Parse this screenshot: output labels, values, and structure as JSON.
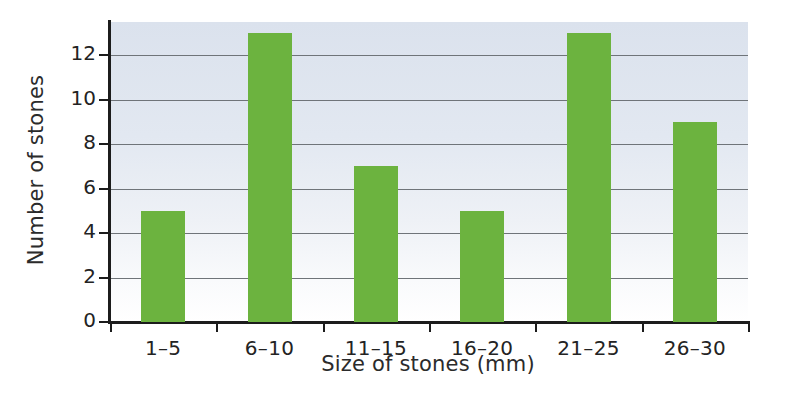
{
  "chart_data": {
    "type": "bar",
    "title": "",
    "subtitle": "",
    "xlabel": "Size of stones (mm)",
    "ylabel": "Number of stones",
    "categories": [
      "1–5",
      "6–10",
      "11–15",
      "16–20",
      "21–25",
      "26–30"
    ],
    "values": [
      5,
      13,
      7,
      5,
      13,
      9
    ],
    "series": [
      {
        "name": "Number of stones",
        "values": [
          5,
          13,
          7,
          5,
          13,
          9
        ]
      }
    ],
    "ylim": [
      0,
      13.5
    ],
    "ytick_values": [
      0,
      2,
      4,
      6,
      8,
      10,
      12
    ],
    "ytick_labels": [
      "0",
      "2",
      "4",
      "6",
      "8",
      "10",
      "12"
    ],
    "xtick_labels": [
      "1–5",
      "6–10",
      "11–15",
      "16–20",
      "21–25",
      "26–30"
    ],
    "grid": "horizontal",
    "legend": "none",
    "bar_color": "#6cb33f",
    "plot_background_top_color": "#dbe2ed",
    "plot_background_bottom_color": "#ffffff",
    "axis_color": "#1c1c1c",
    "gridline_color": "#6f7479",
    "text_color": "#232323",
    "annotations": []
  }
}
